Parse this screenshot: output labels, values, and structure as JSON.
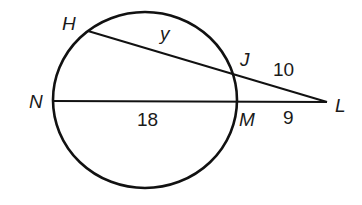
{
  "diagram": {
    "type": "circle-secant-secant",
    "points": {
      "H": {
        "label": "H"
      },
      "J": {
        "label": "J"
      },
      "N": {
        "label": "N"
      },
      "M": {
        "label": "M"
      },
      "L": {
        "label": "L"
      }
    },
    "segments": {
      "HJ": "y",
      "JL": "10",
      "NM": "18",
      "ML": "9"
    },
    "colors": {
      "stroke": "#111111",
      "background": "#ffffff"
    }
  }
}
